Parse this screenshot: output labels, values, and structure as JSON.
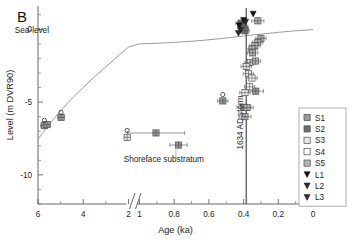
{
  "figure": {
    "panel_label": "B",
    "background": "#ffffff"
  },
  "chart_data": {
    "type": "scatter",
    "title": "",
    "panel_label": "B",
    "xlabel": "Age (ka)",
    "ylabel": "Level (m DVR90)",
    "x_axis": {
      "label": "Age (ka)",
      "reversed": true,
      "broken": true,
      "break_between": [
        2.0,
        1.0
      ],
      "segment_left_range": [
        6.0,
        2.0
      ],
      "segment_right_range": [
        1.0,
        0.0
      ],
      "tick_labels": [
        "6",
        "4",
        "2",
        "1",
        "0.8",
        "0.6",
        "0.4",
        "0.2",
        "0"
      ],
      "tick_values": [
        6,
        4,
        2,
        1,
        0.8,
        0.6,
        0.4,
        0.2,
        0
      ],
      "minor_ticks": [
        5,
        3,
        0.9,
        0.7,
        0.5,
        0.3,
        0.1
      ]
    },
    "y_axis": {
      "label": "Level (m DVR90)",
      "unit": "m DVR90",
      "ylim": [
        -12.0,
        1.6
      ],
      "tick_labels": [
        "0",
        "-5",
        "-10"
      ],
      "tick_values": [
        0,
        -5,
        -10
      ],
      "minor_tick_step": 1
    },
    "grid": false,
    "legend": {
      "position": "right-lower",
      "entries": [
        {
          "label": "S1",
          "marker": "square",
          "fill": "#9a9a9a"
        },
        {
          "label": "S2",
          "marker": "square",
          "fill": "#6e6e6e"
        },
        {
          "label": "S3",
          "marker": "square",
          "fill": "#e8e8e8"
        },
        {
          "label": "S4",
          "marker": "square",
          "fill": "#fcfcfc"
        },
        {
          "label": "S5",
          "marker": "square",
          "fill": "#b5b5b5"
        },
        {
          "label": "L1",
          "marker": "triangle-down",
          "fill": "#111111"
        },
        {
          "label": "L2",
          "marker": "triangle-down",
          "fill": "#2a2a2a"
        },
        {
          "label": "L3",
          "marker": "triangle-down",
          "fill": "#2a2a2a"
        }
      ]
    },
    "annotations": [
      {
        "text": "Sea-level",
        "x": 1.62,
        "y": -0.25,
        "kind": "curve-label"
      },
      {
        "text": "Shoreface substratum",
        "x": 0.86,
        "y": -9.1,
        "kind": "pointer-label"
      },
      {
        "text": "1634 AD storm",
        "x": 0.385,
        "y": -6.4,
        "kind": "vertical-line-label",
        "rotation": -90
      }
    ],
    "reference_lines": [
      {
        "name": "1634 AD storm",
        "orientation": "vertical",
        "x": 0.385,
        "color": "#3a3a3a"
      }
    ],
    "curves": [
      {
        "name": "Sea-level",
        "color": "#8a8a8a",
        "points": [
          [
            6.0,
            -7.55
          ],
          [
            5.6,
            -6.7
          ],
          [
            5.2,
            -5.95
          ],
          [
            4.8,
            -5.25
          ],
          [
            4.4,
            -4.6
          ],
          [
            4.0,
            -4.0
          ],
          [
            3.6,
            -3.4
          ],
          [
            3.2,
            -2.85
          ],
          [
            2.8,
            -2.3
          ],
          [
            2.4,
            -1.75
          ],
          [
            2.1,
            -1.35
          ],
          [
            2.0,
            -1.22
          ],
          [
            1.0,
            -1.0
          ],
          [
            0.9,
            -0.96
          ],
          [
            0.8,
            -0.9
          ],
          [
            0.7,
            -0.82
          ],
          [
            0.6,
            -0.72
          ],
          [
            0.5,
            -0.6
          ],
          [
            0.4,
            -0.46
          ],
          [
            0.3,
            -0.33
          ],
          [
            0.2,
            -0.21
          ],
          [
            0.1,
            -0.1
          ],
          [
            0.0,
            -0.02
          ]
        ]
      }
    ],
    "series": [
      {
        "name": "S1",
        "marker": "crossed-square",
        "fill": "#9a9a9a",
        "points": [
          {
            "x": 5.72,
            "y": -6.62,
            "xerr": 0.16
          },
          {
            "x": 5.6,
            "y": -6.55,
            "xerr": 0.14
          },
          {
            "x": 4.98,
            "y": -6.05,
            "xerr": 0.14
          },
          {
            "x": 0.905,
            "y": -7.12,
            "xerr": 0.165
          },
          {
            "x": 0.775,
            "y": -7.95,
            "xerr": 0.05
          },
          {
            "x": 0.52,
            "y": -4.92,
            "xerr": 0.03
          },
          {
            "x": 0.33,
            "y": -4.25,
            "xerr": 0.045
          }
        ]
      },
      {
        "name": "S2",
        "marker": "crossed-square",
        "fill": "#6e6e6e",
        "points": [
          {
            "x": 0.415,
            "y": 0.42,
            "xerr": 0.03
          },
          {
            "x": 0.405,
            "y": 0.18,
            "xerr": 0.03
          },
          {
            "x": 0.398,
            "y": 0.05,
            "xerr": 0.025
          },
          {
            "x": 0.392,
            "y": -0.1,
            "xerr": 0.025
          }
        ]
      },
      {
        "name": "S3",
        "marker": "crossed-square",
        "fill": "#e8e8e8",
        "points": [
          {
            "x": 2.06,
            "y": -7.42,
            "xerr": 0.06
          },
          {
            "x": 0.362,
            "y": -2.28,
            "xerr": 0.03
          },
          {
            "x": 0.385,
            "y": -2.55,
            "xerr": 0.03
          },
          {
            "x": 0.372,
            "y": -3.05,
            "xerr": 0.03
          }
        ]
      },
      {
        "name": "S4",
        "marker": "crossed-square",
        "fill": "#fcfcfc",
        "points": [
          {
            "x": 0.352,
            "y": -3.35,
            "xerr": 0.03
          },
          {
            "x": 0.365,
            "y": -3.95,
            "xerr": 0.03
          },
          {
            "x": 0.392,
            "y": -4.35,
            "xerr": 0.03
          }
        ]
      },
      {
        "name": "S5",
        "marker": "crossed-square",
        "fill": "#b5b5b5",
        "points": [
          {
            "x": 0.318,
            "y": 0.58,
            "xerr": 0.035
          },
          {
            "x": 0.3,
            "y": -0.62,
            "xerr": 0.03
          },
          {
            "x": 0.318,
            "y": -0.9,
            "xerr": 0.03
          },
          {
            "x": 0.335,
            "y": -1.12,
            "xerr": 0.03
          },
          {
            "x": 0.352,
            "y": -1.35,
            "xerr": 0.03
          },
          {
            "x": 0.348,
            "y": -1.62,
            "xerr": 0.03
          },
          {
            "x": 0.332,
            "y": -2.18,
            "xerr": 0.03
          },
          {
            "x": 0.398,
            "y": -5.35,
            "xerr": 0.04
          },
          {
            "x": 0.38,
            "y": -5.38,
            "xerr": 0.035
          },
          {
            "x": 0.392,
            "y": -6.0,
            "xerr": 0.035
          }
        ]
      },
      {
        "name": "L1",
        "marker": "triangle-down",
        "fill": "#111111",
        "points": [
          {
            "x": 0.345,
            "y": 1.05
          },
          {
            "x": 0.4,
            "y": 0.62
          },
          {
            "x": 0.425,
            "y": 0.25
          }
        ]
      },
      {
        "name": "L2",
        "marker": "triangle-down",
        "fill": "#2a2a2a",
        "points": [
          {
            "x": 0.388,
            "y": 0.5
          },
          {
            "x": 0.418,
            "y": -0.08
          }
        ]
      },
      {
        "name": "L3",
        "marker": "triangle-down",
        "fill": "#2a2a2a",
        "points": [
          {
            "x": 0.43,
            "y": -0.28
          }
        ]
      },
      {
        "name": "open-circles",
        "marker": "open-circle",
        "fill": "none",
        "points": [
          {
            "x": 5.72,
            "y": -6.25
          },
          {
            "x": 4.98,
            "y": -5.7
          },
          {
            "x": 2.06,
            "y": -6.95
          },
          {
            "x": 0.52,
            "y": -4.48
          }
        ]
      }
    ]
  }
}
